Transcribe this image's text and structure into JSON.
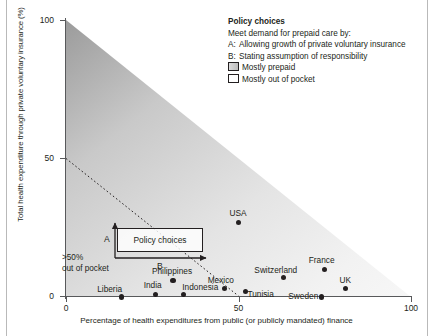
{
  "chart_data": {
    "type": "scatter",
    "title": "",
    "xlabel": "Percentage of health expenditures from public (or publicly mandated) finance",
    "ylabel": "Total health expenditure through private voluntary insurance (%)",
    "xlim": [
      0,
      100
    ],
    "ylim": [
      0,
      100
    ],
    "xticks": [
      "0",
      "50",
      "100"
    ],
    "yticks": [
      "0",
      "50",
      "100"
    ],
    "grid": false,
    "legend_position": "top-right",
    "points": [
      {
        "label": "Liberia",
        "x": 16,
        "y": 0
      },
      {
        "label": "India",
        "x": 26,
        "y": 1
      },
      {
        "label": "Indonesia",
        "x": 34,
        "y": 1
      },
      {
        "label": "Philippines",
        "x": 31,
        "y": 6
      },
      {
        "label": "Mexico",
        "x": 46,
        "y": 3
      },
      {
        "label": "Tunisia",
        "x": 52,
        "y": 2
      },
      {
        "label": "USA",
        "x": 50,
        "y": 27
      },
      {
        "label": "Switzerland",
        "x": 63,
        "y": 7
      },
      {
        "label": "France",
        "x": 75,
        "y": 10
      },
      {
        "label": "UK",
        "x": 81,
        "y": 3
      },
      {
        "label": "Sweden",
        "x": 74,
        "y": 0
      }
    ],
    "annotations": {
      "diagonal_note": "Dotted line from (0,50) to (50,0) separating >50% out of pocket region",
      "out_of_pocket": ">50% out of pocket",
      "policy_box": "Policy choices",
      "arrow_a": "A",
      "arrow_b": "B"
    }
  },
  "axis": {
    "y_label": "Total health expenditure through private voluntary insurance (%)",
    "x_label": "Percentage of health expenditures from public (or publicly mandated) finance",
    "y_ticks": [
      "0",
      "50",
      "100"
    ],
    "x_ticks": [
      "0",
      "50",
      "100"
    ]
  },
  "legend": {
    "title": "Policy choices",
    "subtitle": "Meet demand for prepaid care by:",
    "items": [
      {
        "key": "A:",
        "text": "Allowing growth of private voluntary insurance"
      },
      {
        "key": "B:",
        "text": "Stating assumption of responsibility"
      }
    ],
    "swatches": [
      {
        "style": "filled",
        "text": "Mostly prepaid"
      },
      {
        "style": "open",
        "text": "Mostly out of pocket"
      }
    ]
  },
  "callouts": {
    "policy_box_label": "Policy choices",
    "arrow_a_label": "A",
    "arrow_b_label": "B",
    "out_of_pocket_line1": ">50%",
    "out_of_pocket_line2": "out of pocket"
  },
  "colors": {
    "ink": "#231f20",
    "axis": "#58595b",
    "shade_dark": "#9b9b9b",
    "shade_light": "#f7f7f7"
  }
}
